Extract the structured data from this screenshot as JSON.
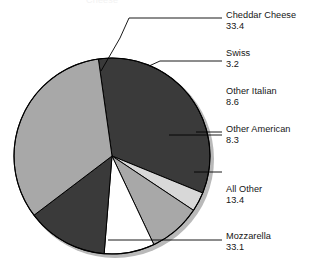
{
  "chart_data": {
    "type": "pie",
    "title": "",
    "xlabel": "",
    "ylabel": "",
    "units": "percent",
    "legend_position": "callout-labels-right",
    "grid": false,
    "categories": [
      "Cheddar Cheese",
      "Swiss",
      "Other Italian",
      "Other American",
      "All Other",
      "Mozzarella"
    ],
    "values": [
      33.4,
      3.2,
      8.6,
      8.3,
      13.4,
      33.1
    ],
    "slices": [
      {
        "label": "Cheddar Cheese",
        "value": 33.4,
        "color": "#3a3a3a",
        "start_angle": 352.0,
        "end_angle": 112.2
      },
      {
        "label": "Swiss",
        "value": 3.2,
        "color": "#d8d8d8",
        "start_angle": 112.2,
        "end_angle": 123.7
      },
      {
        "label": "Other Italian",
        "value": 8.6,
        "color": "#a8a8a8",
        "start_angle": 123.7,
        "end_angle": 154.7
      },
      {
        "label": "Other American",
        "value": 8.3,
        "color": "#ffffff",
        "start_angle": 154.7,
        "end_angle": 184.6
      },
      {
        "label": "All Other",
        "value": 13.4,
        "color": "#3a3a3a",
        "start_angle": 184.6,
        "end_angle": 232.8
      },
      {
        "label": "Mozzarella",
        "value": 33.1,
        "color": "#a8a8a8",
        "start_angle": 232.8,
        "end_angle": 352.0
      }
    ],
    "colors": {
      "dark": "#3a3a3a",
      "medium": "#a8a8a8",
      "light": "#d8d8d8",
      "white": "#ffffff",
      "outline": "#000000",
      "shadow": "#b5b5b5",
      "leader": "#000000",
      "text": "#151515",
      "background": "#ffffff"
    }
  },
  "labels": [
    {
      "name": "Cheddar Cheese",
      "value": "33.4"
    },
    {
      "name": "Swiss",
      "value": "3.2"
    },
    {
      "name": "Other Italian",
      "value": "8.6"
    },
    {
      "name": "Other American",
      "value": "8.3"
    },
    {
      "name": "All Other",
      "value": "13.4"
    },
    {
      "name": "Mozzarella",
      "value": "33.1"
    }
  ],
  "clipped_title": "Cheese"
}
